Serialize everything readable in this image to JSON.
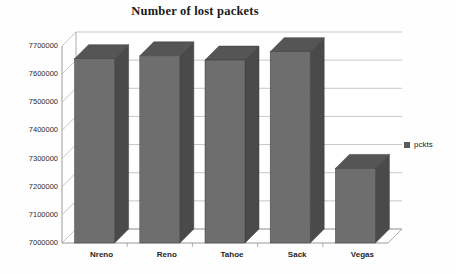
{
  "chart_data": {
    "type": "bar",
    "title": "Number of lost packets",
    "xlabel": "",
    "ylabel": "",
    "categories": [
      "Nreno",
      "Reno",
      "Tahoe",
      "Sack",
      "Vegas"
    ],
    "series": [
      {
        "name": "pckts",
        "values": [
          7655000,
          7665000,
          7650000,
          7680000,
          7265000
        ]
      }
    ],
    "ylim": [
      7000000,
      7700000
    ],
    "ytick_labels": [
      "7700000",
      "7600000",
      "7500000",
      "7400000",
      "7300000",
      "7200000",
      "7100000",
      "7000000"
    ],
    "ytick_values": [
      7700000,
      7600000,
      7500000,
      7400000,
      7300000,
      7200000,
      7100000,
      7000000
    ],
    "grid": true,
    "legend": {
      "position": "right",
      "entries": [
        {
          "label": "pckts",
          "color": "#5a5a5a"
        }
      ]
    },
    "style": {
      "three_d": true,
      "bar_front_color": "#6e6e6e",
      "bar_side_color": "#4a4a4a",
      "bar_top_color": "#555555",
      "gridline_color": "#b9b9b9",
      "axis_color": "#9a9a9a",
      "plot_background": "#ffffff",
      "text_color": "#1f1f1f"
    }
  }
}
